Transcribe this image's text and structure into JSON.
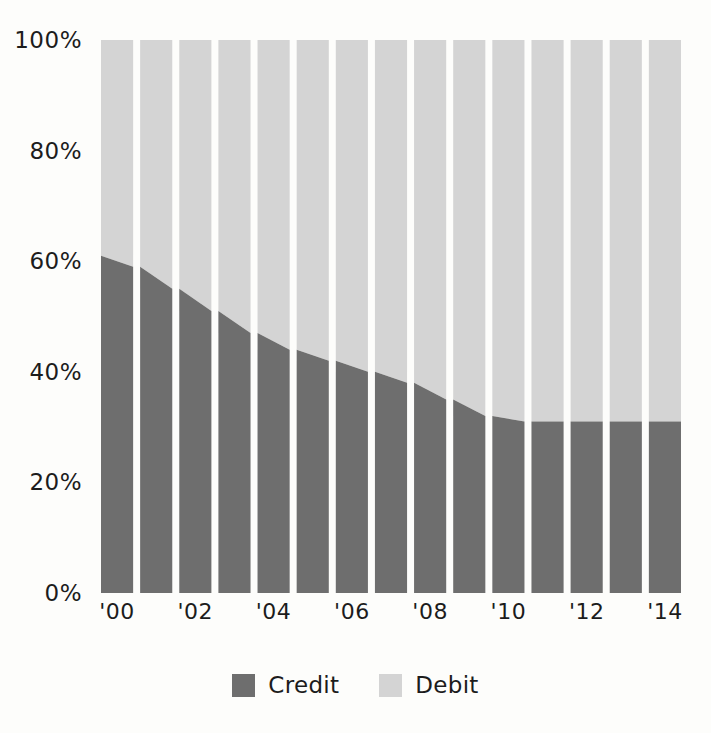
{
  "chart_data": {
    "type": "area",
    "title": "",
    "subtitle": "",
    "xlabel": "",
    "ylabel": "",
    "stacked": true,
    "stack_total": 100,
    "grid": false,
    "legend_position": "bottom",
    "ylim": [
      0,
      100
    ],
    "categories": [
      "'00",
      "'01",
      "'02",
      "'03",
      "'04",
      "'05",
      "'06",
      "'07",
      "'08",
      "'09",
      "'10",
      "'11",
      "'12",
      "'13",
      "'14"
    ],
    "x": [
      2000,
      2001,
      2002,
      2003,
      2004,
      2005,
      2006,
      2007,
      2008,
      2009,
      2010,
      2011,
      2012,
      2013,
      2014
    ],
    "x_tick_labels": [
      "'00",
      "'02",
      "'04",
      "'06",
      "'08",
      "'10",
      "'12",
      "'14"
    ],
    "x_tick_indices": [
      0,
      2,
      4,
      6,
      8,
      10,
      12,
      14
    ],
    "y_tick_labels": [
      "100%",
      "80%",
      "60%",
      "40%",
      "20%",
      "0%"
    ],
    "y_tick_values": [
      100,
      80,
      60,
      40,
      20,
      0
    ],
    "series": [
      {
        "name": "Credit",
        "color": "#6e6e6e",
        "values": [
          61,
          57,
          53,
          49,
          45,
          43,
          41,
          39,
          37,
          33,
          31,
          31,
          31,
          31,
          31
        ]
      },
      {
        "name": "Debit",
        "color": "#d4d4d4",
        "values": [
          39,
          43,
          47,
          51,
          55,
          57,
          59,
          61,
          63,
          67,
          69,
          69,
          69,
          69,
          69
        ]
      }
    ]
  },
  "legend": {
    "items": [
      {
        "label": "Credit",
        "color": "#6e6e6e"
      },
      {
        "label": "Debit",
        "color": "#d4d4d4"
      }
    ]
  },
  "colors": {
    "credit": "#6e6e6e",
    "debit": "#d4d4d4",
    "background": "#fdfdfb",
    "text": "#1c1c1c",
    "gap": "#fdfdfb"
  }
}
